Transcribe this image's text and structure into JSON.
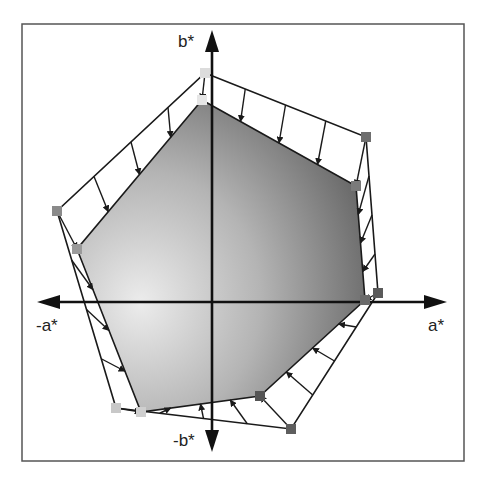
{
  "diagram": {
    "type": "color-gamut-comparison",
    "axes": {
      "positive_a": "a*",
      "negative_a": "-a*",
      "positive_b": "b*",
      "negative_b": "-b*"
    },
    "outer_gamut": {
      "vertices": [
        [
          205,
          73
        ],
        [
          366,
          137
        ],
        [
          378,
          293
        ],
        [
          291,
          429
        ],
        [
          116,
          408
        ],
        [
          57,
          211
        ]
      ],
      "marker_colors": [
        "#dcdcdc",
        "#6e6e6e",
        "#5a5a5a",
        "#5e5e5e",
        "#c8c8c8",
        "#8a8a8a"
      ]
    },
    "inner_gamut": {
      "vertices": [
        [
          202,
          100
        ],
        [
          356,
          186
        ],
        [
          365,
          300
        ],
        [
          260,
          396
        ],
        [
          141,
          412
        ],
        [
          77,
          249
        ]
      ],
      "marker_colors": [
        "#e6e6e6",
        "#7a7a7a",
        "#6a6a6a",
        "#555555",
        "#cfcfcf",
        "#9a9a9a"
      ]
    },
    "colors": {
      "frame": "#555555",
      "axis": "#111111",
      "line": "#1a1a1a",
      "fill_light": "#e8e8e8",
      "fill_dark": "#5c5c5c"
    }
  },
  "caption": ""
}
